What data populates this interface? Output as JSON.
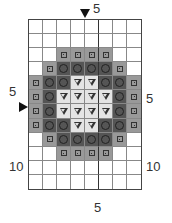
{
  "chart": {
    "columns": 8,
    "rows": 12,
    "labels": {
      "top": "5",
      "bottom": "5",
      "left_row5": "5",
      "left_row10": "10",
      "right_row5": "5",
      "right_row10": "10"
    },
    "colors": {
      "square_bg": "#999999",
      "circle_bg": "#555555",
      "triangle_bg": "#e4e4e4",
      "empty_bg": "#ffffff"
    },
    "legend_symbols": {
      "sq": "small square with dot",
      "ci": "circle",
      "tr": "downward triangle",
      ".": "empty"
    },
    "pattern": [
      [
        ".",
        ".",
        ".",
        ".",
        ".",
        ".",
        ".",
        "."
      ],
      [
        ".",
        ".",
        ".",
        ".",
        ".",
        ".",
        ".",
        "."
      ],
      [
        ".",
        ".",
        "sq",
        "sq",
        "sq",
        "sq",
        ".",
        "."
      ],
      [
        ".",
        "sq",
        "ci",
        "ci",
        "ci",
        "ci",
        "sq",
        "."
      ],
      [
        "sq",
        "ci",
        "ci",
        "tr",
        "tr",
        "ci",
        "ci",
        "sq"
      ],
      [
        "sq",
        "ci",
        "tr",
        "tr",
        "tr",
        "tr",
        "ci",
        "sq"
      ],
      [
        "sq",
        "ci",
        "tr",
        "tr",
        "tr",
        "tr",
        "ci",
        "sq"
      ],
      [
        "sq",
        "ci",
        "ci",
        "tr",
        "tr",
        "ci",
        "ci",
        "sq"
      ],
      [
        ".",
        "sq",
        "ci",
        "ci",
        "ci",
        "ci",
        "sq",
        "."
      ],
      [
        ".",
        ".",
        "sq",
        "sq",
        "sq",
        "sq",
        ".",
        "."
      ],
      [
        ".",
        ".",
        ".",
        ".",
        ".",
        ".",
        ".",
        "."
      ],
      [
        ".",
        ".",
        ".",
        ".",
        ".",
        ".",
        ".",
        "."
      ]
    ]
  }
}
